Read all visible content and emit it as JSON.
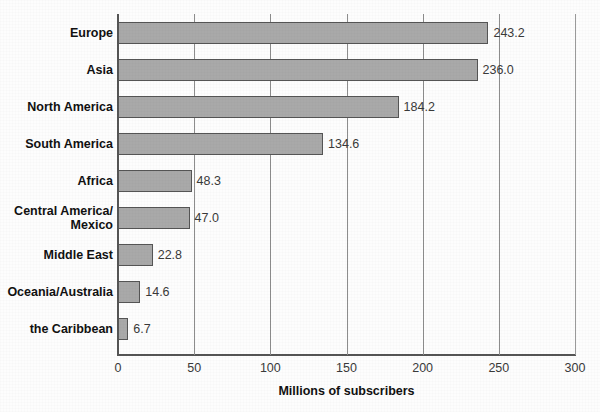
{
  "chart_data": {
    "type": "bar",
    "orientation": "horizontal",
    "title": "",
    "xlabel": "Millions of subscribers",
    "ylabel": "",
    "xlim": [
      0,
      300
    ],
    "xticks": [
      0,
      50,
      100,
      150,
      200,
      250,
      300
    ],
    "grid": true,
    "legend": "none",
    "categories": [
      "Europe",
      "Asia",
      "North America",
      "South America",
      "Africa",
      "Central America/\nMexico",
      "Middle East",
      "Oceania/Australia",
      "the Caribbean"
    ],
    "values": [
      243.2,
      236.0,
      184.2,
      134.6,
      48.3,
      47.0,
      22.8,
      14.6,
      6.7
    ],
    "value_labels": [
      "243.2",
      "236.0",
      "184.2",
      "134.6",
      "48.3",
      "47.0",
      "22.8",
      "14.6",
      "6.7"
    ],
    "colors": {
      "bar_fill": "#a9a9a9",
      "bar_stroke": "#555555",
      "gridline": "#8d8d8d",
      "axis": "#555555",
      "label_text": "#111111",
      "value_text": "#3a3a3a",
      "background": "#fdfdfd"
    }
  }
}
